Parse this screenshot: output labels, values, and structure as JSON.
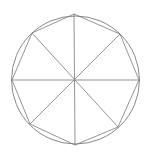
{
  "diagram": {
    "background": "#ffffff",
    "stroke_color": "#7a7a7a",
    "circle": {
      "cx": 75.5,
      "cy": 80,
      "r": 64
    },
    "octagon_vertices": [
      [
        74,
        14
      ],
      [
        120,
        34
      ],
      [
        139,
        80
      ],
      [
        118,
        127
      ],
      [
        75,
        145
      ],
      [
        30,
        124
      ],
      [
        12,
        80
      ],
      [
        32,
        33
      ]
    ],
    "center": [
      74,
      80
    ]
  }
}
